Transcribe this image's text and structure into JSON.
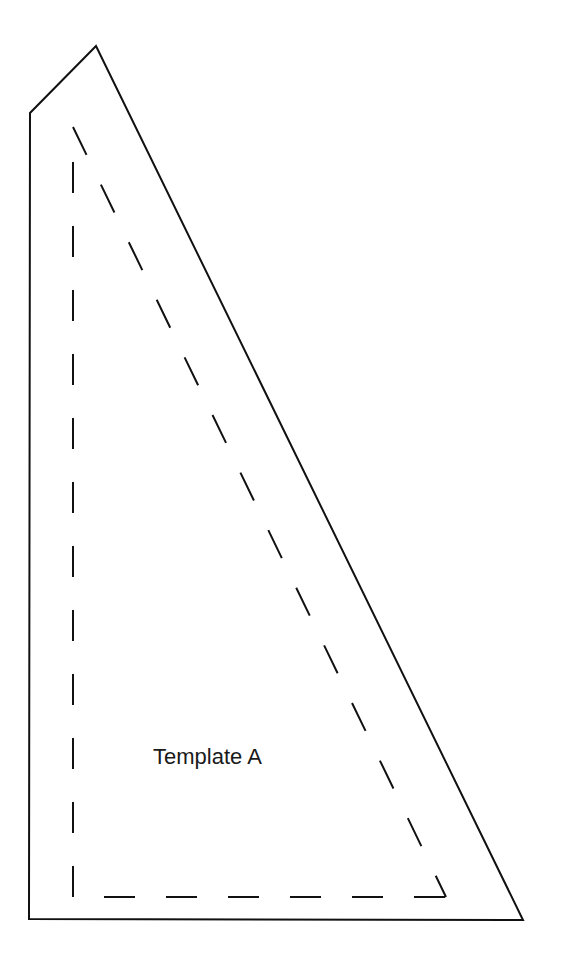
{
  "diagram": {
    "title": "Template A",
    "outer_shape": {
      "points": [
        [
          96,
          46
        ],
        [
          30,
          113
        ],
        [
          29,
          919
        ],
        [
          523,
          920
        ]
      ],
      "stroke": "#111111",
      "stroke_width": 2
    },
    "seam_line": {
      "style": "dashed",
      "points": [
        [
          73,
          127
        ],
        [
          73,
          898
        ],
        [
          446,
          898
        ],
        [
          73,
          127
        ]
      ],
      "stroke": "#111111"
    }
  }
}
